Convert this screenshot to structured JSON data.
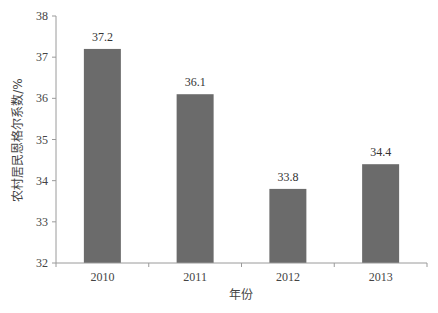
{
  "chart_data": {
    "type": "bar",
    "title": "",
    "xlabel": "年份",
    "ylabel": "农村居民恩格尔系数/%",
    "categories": [
      "2010",
      "2011",
      "2012",
      "2013"
    ],
    "values": [
      37.2,
      36.1,
      33.8,
      34.4
    ],
    "data_labels": [
      "37.2",
      "36.1",
      "33.8",
      "34.4"
    ],
    "ylim": [
      32,
      38
    ],
    "yticks": [
      32,
      33,
      34,
      35,
      36,
      37,
      38
    ],
    "grid": false,
    "legend": null,
    "colors": {
      "bar": "#6b6b6b",
      "axis": "#9a9a9a"
    }
  }
}
